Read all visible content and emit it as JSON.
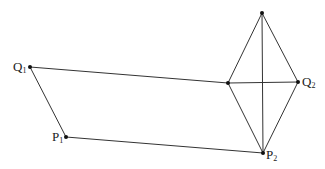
{
  "diagram": {
    "type": "geometric-construction",
    "colors": {
      "line": "#333333",
      "point": "#111111",
      "text": "#222222",
      "background": "#ffffff"
    },
    "points": [
      {
        "id": "Q1",
        "label": "Q",
        "sub": "1",
        "x": 30,
        "y": 67,
        "label_pos": "left"
      },
      {
        "id": "P1",
        "label": "P",
        "sub": "1",
        "x": 66,
        "y": 137,
        "label_pos": "left"
      },
      {
        "id": "T",
        "label": "",
        "sub": "",
        "x": 262,
        "y": 13,
        "label_pos": "none"
      },
      {
        "id": "L",
        "label": "",
        "sub": "",
        "x": 228,
        "y": 83,
        "label_pos": "none"
      },
      {
        "id": "Q2",
        "label": "Q",
        "sub": "2",
        "x": 298,
        "y": 82,
        "label_pos": "right"
      },
      {
        "id": "P2",
        "label": "P",
        "sub": "2",
        "x": 263,
        "y": 153,
        "label_pos": "right"
      }
    ],
    "segments": [
      [
        "Q1",
        "L"
      ],
      [
        "Q1",
        "P1"
      ],
      [
        "P1",
        "P2"
      ],
      [
        "T",
        "L"
      ],
      [
        "T",
        "Q2"
      ],
      [
        "L",
        "P2"
      ],
      [
        "Q2",
        "P2"
      ],
      [
        "T",
        "P2"
      ],
      [
        "L",
        "Q2"
      ]
    ],
    "labels": {
      "q1": {
        "main": "Q",
        "sub": "1"
      },
      "p1": {
        "main": "P",
        "sub": "1"
      },
      "q2": {
        "main": "Q",
        "sub": "2"
      },
      "p2": {
        "main": "P",
        "sub": "2"
      }
    }
  }
}
